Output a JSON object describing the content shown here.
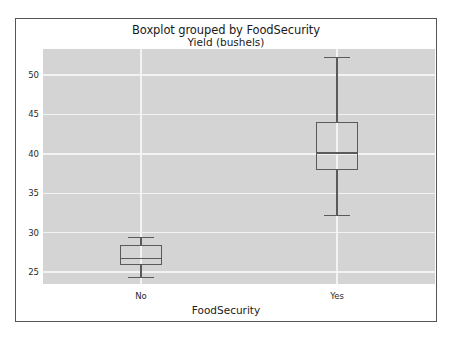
{
  "chart_data": {
    "type": "box",
    "title": "Boxplot grouped by FoodSecurity",
    "subtitle": "Yield (bushels)",
    "xlabel": "FoodSecurity",
    "ylabel": "",
    "categories": [
      "No",
      "Yes"
    ],
    "ylim": [
      23.5,
      53.3
    ],
    "yticks": [
      25,
      30,
      35,
      40,
      45,
      50
    ],
    "ytick_labels": [
      "25",
      "30",
      "35",
      "40",
      "45",
      "50"
    ],
    "grid": "horizontal-and-vertical",
    "legend": "none",
    "boxes": [
      {
        "category": "No",
        "whisker_low": 24.3,
        "q1": 25.9,
        "median": 26.7,
        "q3": 28.4,
        "whisker_high": 29.4,
        "outliers": []
      },
      {
        "category": "Yes",
        "whisker_low": 32.2,
        "q1": 37.9,
        "median": 40.1,
        "q3": 44.1,
        "whisker_high": 52.2,
        "outliers": []
      }
    ],
    "colors": {
      "plot_background": "#d4d4d4",
      "gridline": "#f3f3f3",
      "box_stroke": "#5a5a5a",
      "figure_background": "#ffffff",
      "frame_border": "#555555",
      "text": "#1a1a1a"
    }
  }
}
